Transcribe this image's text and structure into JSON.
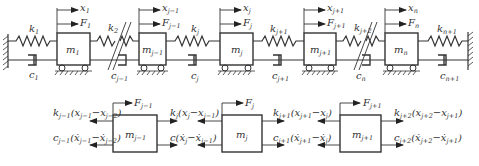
{
  "diagram": {
    "type": "multi-degree-of-freedom spring-mass-damper chain with free-body diagrams",
    "top_row": {
      "masses": [
        {
          "label": "m",
          "sub": "1",
          "x_label": "x",
          "x_sub": "1",
          "f_label": "F",
          "f_sub": "1"
        },
        {
          "label": "m",
          "sub": "j−1",
          "x_label": "x",
          "x_sub": "j−1",
          "f_label": "F",
          "f_sub": "j−1"
        },
        {
          "label": "m",
          "sub": "j",
          "x_label": "x",
          "x_sub": "j",
          "f_label": "F",
          "f_sub": "j"
        },
        {
          "label": "m",
          "sub": "j+1",
          "x_label": "x",
          "x_sub": "j+1",
          "f_label": "F",
          "f_sub": "j+1"
        },
        {
          "label": "m",
          "sub": "n",
          "x_label": "x",
          "x_sub": "n",
          "f_label": "F",
          "f_sub": "n"
        }
      ],
      "springs": [
        {
          "label": "k",
          "sub": "1"
        },
        {
          "label": "k",
          "sub": "2"
        },
        {
          "label": "k",
          "sub": "j"
        },
        {
          "label": "k",
          "sub": "j+1"
        },
        {
          "label": "k",
          "sub": "j+2"
        },
        {
          "label": "k",
          "sub": "n+1"
        }
      ],
      "dampers": [
        {
          "label": "c",
          "sub": "1"
        },
        {
          "label": "c",
          "sub": "j−1"
        },
        {
          "label": "c",
          "sub": "j"
        },
        {
          "label": "c",
          "sub": "j+1"
        },
        {
          "label": "c",
          "sub": "n"
        },
        {
          "label": "c",
          "sub": "n+1"
        }
      ]
    },
    "bottom_row": {
      "free_bodies": [
        {
          "mass": {
            "label": "m",
            "sub": "j−1"
          },
          "force": {
            "label": "F",
            "sub": "j−1"
          },
          "left_spring_force": "k_{j-1}(x_{j-1} − x_{j-2})",
          "left_damper_force": "c_{j-1}(ẋ_{j-1} − ẋ_{j-2})"
        },
        {
          "mass": {
            "label": "m",
            "sub": "j"
          },
          "force": {
            "label": "F",
            "sub": "j"
          },
          "left_spring_force": "k_j(x_j − x_{j-1})",
          "left_damper_force": "c(ẋ_j − ẋ_{j-1})",
          "right_spring_force": "k_{j+1}(x_{j+1} − x_j)",
          "right_damper_force": "c_{j+1}(ẋ_{j+1} − ẋ_j)"
        },
        {
          "mass": {
            "label": "m",
            "sub": "j+1"
          },
          "force": {
            "label": "F",
            "sub": "j+1"
          },
          "right_spring_force": "k_{j+2}(x_{j+2} − x_{j+1})",
          "right_damper_force": "c_{j+2}(ẋ_{j+2} − ẋ_{j+1})"
        }
      ]
    }
  },
  "text": {
    "m1": "1",
    "mjm1": "j−1",
    "mj": "j",
    "mjp1": "j+1",
    "mn": "n",
    "k1": "1",
    "k2": "2",
    "kj": "j",
    "kjp1": "j+1",
    "kjp2": "j+2",
    "knp1": "n+1",
    "c1": "1",
    "cjm1": "j−1",
    "cj": "j",
    "cjp1": "j+1",
    "cn": "n",
    "cnp1": "n+1",
    "x1": "1",
    "xjm1": "j−1",
    "xj": "j",
    "xjp1": "j+1",
    "xn": "n",
    "F1": "1",
    "Fjm1": "j−1",
    "Fj": "j",
    "Fjp1": "j+1",
    "Fn": "n",
    "m": "m",
    "k": "k",
    "c": "c",
    "x": "x",
    "F": "F",
    "fb1_spring": "k",
    "fb1_spring_sub": "j−1",
    "fb1_spring_expr": "(x",
    "fb1_s_a": "j−1",
    "fb1_s_mid": "−x",
    "fb1_s_b": "j−2",
    "fb1_close": ")",
    "fb1_damper": "c",
    "fb1_damper_sub": "j−1",
    "fb1_damper_expr": "(ẋ",
    "fb1_d_a": "j−1",
    "fb1_d_mid": "−ẋ",
    "fb1_d_b": "j−2",
    "fb2_ls": "k",
    "fb2_ls_sub": "j",
    "fb2_ls_expr": "(x",
    "fb2_ls_a": "j",
    "fb2_ls_mid": "−x",
    "fb2_ls_b": "j−1",
    "fb2_ld": "c",
    "fb2_ld_expr": "(ẋ",
    "fb2_ld_a": "j",
    "fb2_ld_mid": "−ẋ",
    "fb2_ld_b": "j−1",
    "fb2_rs": "k",
    "fb2_rs_sub": "j+1",
    "fb2_rs_expr": "(x",
    "fb2_rs_a": "j+1",
    "fb2_rs_mid": "−x",
    "fb2_rs_b": "j",
    "fb2_rd": "c",
    "fb2_rd_sub": "j+1",
    "fb2_rd_expr": "(ẋ",
    "fb2_rd_a": "j+1",
    "fb2_rd_mid": "−ẋ",
    "fb2_rd_b": "j",
    "fb3_rs": "k",
    "fb3_rs_sub": "j+2",
    "fb3_rs_expr": "(x",
    "fb3_rs_a": "j+2",
    "fb3_rs_mid": "−x",
    "fb3_rs_b": "j+1",
    "fb3_rd": "c",
    "fb3_rd_sub": "j+2",
    "fb3_rd_expr": "(ẋ",
    "fb3_rd_a": "j+2",
    "fb3_rd_mid": "−ẋ",
    "fb3_rd_b": "j+1"
  }
}
